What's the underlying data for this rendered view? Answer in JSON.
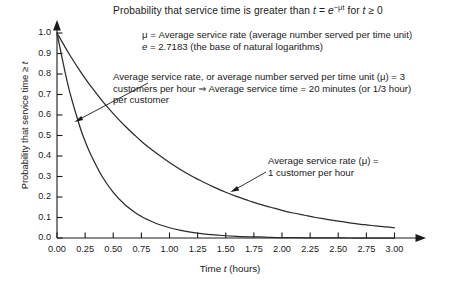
{
  "chart_data": {
    "type": "line",
    "title_parts": {
      "lead": "Probability that service time is greater than ",
      "var_t": "t",
      "equals": " = ",
      "base_e": "e",
      "exponent": "−μt",
      "tail_pre": " for ",
      "tail_var": "t",
      "tail_post": " ≥ 0"
    },
    "xlabel": "Time t (hours)",
    "xlabel_parts": {
      "pre": "Time ",
      "var": "t",
      "post": " (hours)"
    },
    "ylabel": "Probability that service time ≥ t",
    "ylabel_parts": {
      "pre": "Probability that service time ≥ ",
      "var": "t"
    },
    "xlim": [
      0,
      3.25
    ],
    "ylim": [
      0,
      1.0
    ],
    "xticks": [
      "0.00",
      "0.25",
      "0.50",
      "0.75",
      "1.00",
      "1.25",
      "1.50",
      "1.75",
      "2.00",
      "2.25",
      "2.50",
      "2.75",
      "3.00"
    ],
    "xtick_values": [
      0,
      0.25,
      0.5,
      0.75,
      1.0,
      1.25,
      1.5,
      1.75,
      2.0,
      2.25,
      2.5,
      2.75,
      3.0
    ],
    "yticks": [
      "0.0",
      "0.1",
      "0.2",
      "0.3",
      "0.4",
      "0.5",
      "0.6",
      "0.7",
      "0.8",
      "0.9",
      "1.0"
    ],
    "ytick_values": [
      0,
      0.1,
      0.2,
      0.3,
      0.4,
      0.5,
      0.6,
      0.7,
      0.8,
      0.9,
      1.0
    ],
    "grid": false,
    "legend": "none",
    "axis_arrows": true,
    "series": [
      {
        "name": "Average service rate (μ) = 3 customers per hour",
        "mu": 3,
        "color": "#2b2b2b",
        "x": [
          0,
          0.1,
          0.2,
          0.25,
          0.3,
          0.4,
          0.5,
          0.6,
          0.7,
          0.75,
          0.8,
          0.9,
          1.0,
          1.1,
          1.2,
          1.25,
          1.3,
          1.4,
          1.5,
          1.6,
          1.7,
          1.75,
          1.8,
          1.9,
          2.0,
          2.1,
          2.2,
          2.25,
          2.3,
          2.4,
          2.5,
          2.6,
          2.7,
          2.75,
          2.8,
          2.9,
          3.0
        ],
        "values": [
          1.0,
          0.741,
          0.549,
          0.472,
          0.407,
          0.301,
          0.223,
          0.165,
          0.122,
          0.105,
          0.091,
          0.067,
          0.05,
          0.037,
          0.027,
          0.024,
          0.02,
          0.015,
          0.011,
          0.008,
          0.006,
          0.005,
          0.005,
          0.003,
          0.002,
          0.002,
          0.001,
          0.001,
          0.001,
          0.001,
          0.001,
          0.0,
          0.0,
          0.0,
          0.0,
          0.0,
          0.0
        ]
      },
      {
        "name": "Average service rate (μ) = 1 customer per hour",
        "mu": 1,
        "color": "#2b2b2b",
        "x": [
          0,
          0.1,
          0.2,
          0.25,
          0.3,
          0.4,
          0.5,
          0.6,
          0.7,
          0.75,
          0.8,
          0.9,
          1.0,
          1.1,
          1.2,
          1.25,
          1.3,
          1.4,
          1.5,
          1.6,
          1.7,
          1.75,
          1.8,
          1.9,
          2.0,
          2.1,
          2.2,
          2.25,
          2.3,
          2.4,
          2.5,
          2.6,
          2.7,
          2.75,
          2.8,
          2.9,
          3.0
        ],
        "values": [
          1.0,
          0.905,
          0.819,
          0.779,
          0.741,
          0.67,
          0.607,
          0.549,
          0.497,
          0.472,
          0.449,
          0.407,
          0.368,
          0.333,
          0.301,
          0.287,
          0.273,
          0.247,
          0.223,
          0.202,
          0.183,
          0.174,
          0.165,
          0.15,
          0.135,
          0.122,
          0.111,
          0.105,
          0.1,
          0.091,
          0.082,
          0.074,
          0.067,
          0.064,
          0.061,
          0.055,
          0.05
        ]
      }
    ],
    "annotations": [
      {
        "id": "mu-definition",
        "lines": [
          "μ = Average service rate (average number served per time unit)",
          "e = 2.7183 (the base of natural logarithms)"
        ],
        "line1_parts": {
          "sym": "μ",
          "rest": " = Average service rate (average number served per time unit)"
        },
        "line2_parts": {
          "sym": "e",
          "rest": " = 2.7183 (the base of natural logarithms)"
        }
      },
      {
        "id": "mu-3-callout",
        "target_series": "Average service rate (μ) = 3 customers per hour",
        "lines": [
          "Average service rate, or average number served per time unit (μ) = 3",
          "customers per hour ⇒ Average service time = 20 minutes (or 1/3 hour)",
          "per customer"
        ],
        "has_leader_arrow": true
      },
      {
        "id": "mu-1-callout",
        "target_series": "Average service rate (μ) = 1 customer per hour",
        "lines": [
          "Average service rate (μ) =",
          "1 customer per hour"
        ],
        "has_leader_arrow": true
      }
    ]
  }
}
